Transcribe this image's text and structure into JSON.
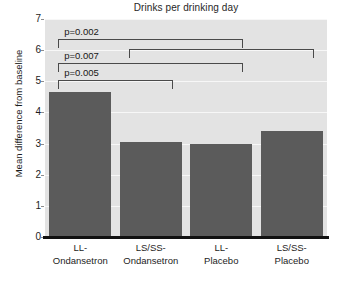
{
  "chart_data": {
    "type": "bar",
    "title": "Drinks per drinking day",
    "xlabel": "",
    "ylabel": "Mean difference from baseline",
    "categories": [
      "LL-\nOndansetron",
      "LS/SS-\nOndansetron",
      "LL-\nPlacebo",
      "LS/SS-\nPlacebo"
    ],
    "category_lines": [
      [
        "LL-",
        "Ondansetron"
      ],
      [
        "LS/SS-",
        "Ondansetron"
      ],
      [
        "LL-",
        "Placebo"
      ],
      [
        "LS/SS-",
        "Placebo"
      ]
    ],
    "values": [
      4.65,
      3.05,
      3.0,
      3.4
    ],
    "ylim": [
      0,
      7
    ],
    "yticks": [
      0,
      1,
      2,
      3,
      4,
      5,
      6,
      7
    ],
    "ytick_labels": [
      "0",
      "1",
      "2",
      "3",
      "4",
      "5",
      "6",
      "7"
    ],
    "grid": true,
    "grid_color": "#f7f7f7",
    "legend": "none",
    "bar_color": "#5b5b5b",
    "plot_background": "#e3e3e3",
    "annotations": [
      {
        "label": "p=0.002",
        "from": 0,
        "to": 2,
        "level": 6.35
      },
      {
        "label": "",
        "from": 1,
        "to": 3,
        "level": 6.05
      },
      {
        "label": "p=0.007",
        "from": 0,
        "to": 2,
        "level": 5.6
      },
      {
        "label": "p=0.005",
        "from": 0,
        "to": 1,
        "level": 5.05
      }
    ]
  }
}
